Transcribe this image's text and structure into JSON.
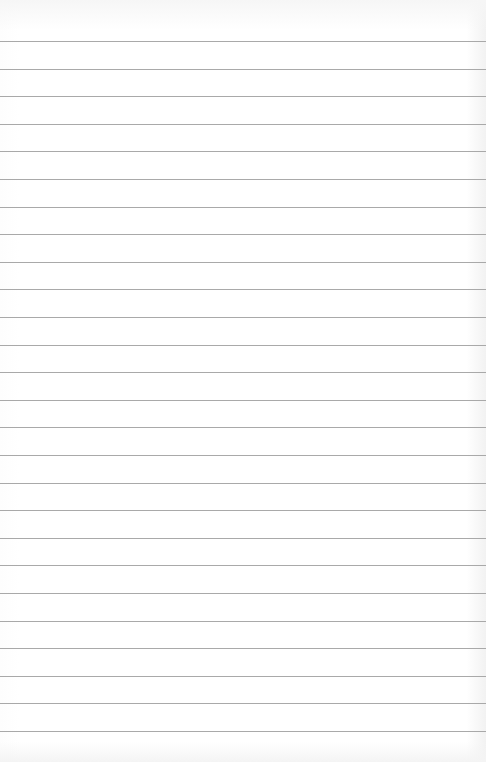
{
  "page": {
    "type": "lined-paper",
    "background_color": "#ffffff",
    "line_color": "#a9a9a9",
    "first_line_y": 41,
    "line_spacing": 27.6,
    "line_count": 26
  }
}
